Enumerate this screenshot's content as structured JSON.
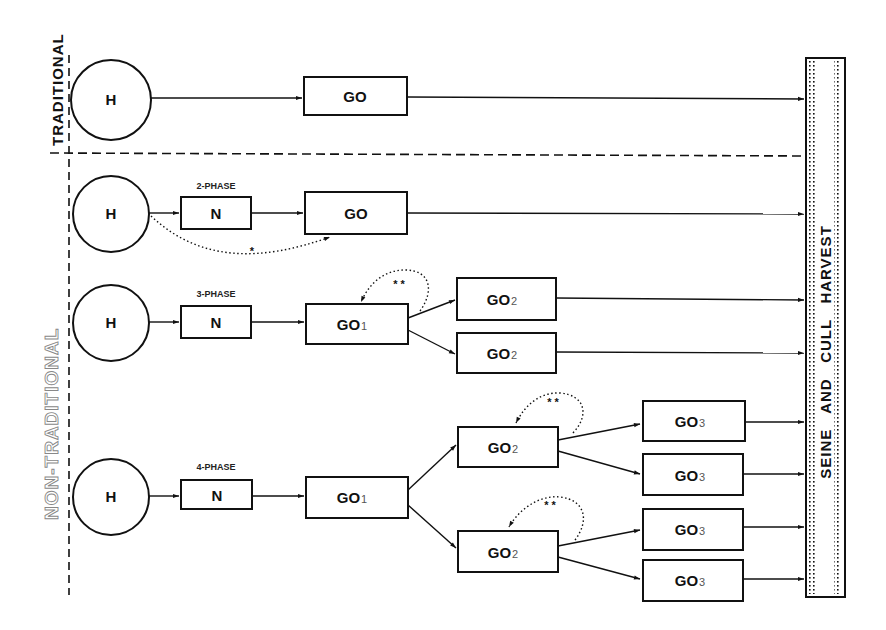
{
  "diagram": {
    "sections": {
      "traditional": {
        "label": "TRADITIONAL"
      },
      "non_traditional": {
        "label": "NON-TRADITIONAL"
      }
    },
    "harvest_bar": {
      "label": "SEINE   AND   CULL   HARVEST"
    },
    "rows": [
      {
        "id": "traditional",
        "phase_label": "",
        "nodes": [
          {
            "id": "H",
            "label": "H",
            "shape": "circle"
          },
          {
            "id": "GO",
            "label": "GO",
            "sub": "",
            "shape": "rect"
          }
        ]
      },
      {
        "id": "2-phase",
        "phase_label": "2-PHASE",
        "nodes": [
          {
            "id": "H",
            "label": "H",
            "shape": "circle"
          },
          {
            "id": "N",
            "label": "N",
            "shape": "rect"
          },
          {
            "id": "GO",
            "label": "GO",
            "sub": "",
            "shape": "rect"
          }
        ],
        "bypass_marker": "*"
      },
      {
        "id": "3-phase",
        "phase_label": "3-PHASE",
        "nodes": [
          {
            "id": "H",
            "label": "H",
            "shape": "circle"
          },
          {
            "id": "N",
            "label": "N",
            "shape": "rect"
          },
          {
            "id": "GO1",
            "label": "GO",
            "sub": "1",
            "shape": "rect"
          },
          {
            "id": "GO2a",
            "label": "GO",
            "sub": "2",
            "shape": "rect"
          },
          {
            "id": "GO2b",
            "label": "GO",
            "sub": "2",
            "shape": "rect"
          }
        ],
        "loop_marker": "* *"
      },
      {
        "id": "4-phase",
        "phase_label": "4-PHASE",
        "nodes": [
          {
            "id": "H",
            "label": "H",
            "shape": "circle"
          },
          {
            "id": "N",
            "label": "N",
            "shape": "rect"
          },
          {
            "id": "GO1",
            "label": "GO",
            "sub": "1",
            "shape": "rect"
          },
          {
            "id": "GO2a",
            "label": "GO",
            "sub": "2",
            "shape": "rect"
          },
          {
            "id": "GO2b",
            "label": "GO",
            "sub": "2",
            "shape": "rect"
          },
          {
            "id": "GO3a",
            "label": "GO",
            "sub": "3",
            "shape": "rect"
          },
          {
            "id": "GO3b",
            "label": "GO",
            "sub": "3",
            "shape": "rect"
          },
          {
            "id": "GO3c",
            "label": "GO",
            "sub": "3",
            "shape": "rect"
          },
          {
            "id": "GO3d",
            "label": "GO",
            "sub": "3",
            "shape": "rect"
          }
        ],
        "loop_marker": "* *"
      }
    ]
  }
}
